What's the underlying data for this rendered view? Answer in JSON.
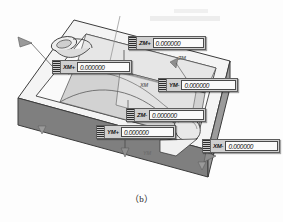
{
  "figure": {
    "caption": "（b）"
  },
  "callouts": [
    {
      "id": "zm-plus",
      "tag": "ZM+",
      "value": "0.000000",
      "grip": "drag-grip"
    },
    {
      "id": "xm-plus",
      "tag": "XM+",
      "value": "0.000000",
      "grip": "drag-grip"
    },
    {
      "id": "ym-minus",
      "tag": "YM-",
      "value": "0.000000",
      "grip": "drag-grip"
    },
    {
      "id": "zm-minus",
      "tag": "ZM-",
      "value": "0.000000",
      "grip": "drag-grip"
    },
    {
      "id": "ym-plus",
      "tag": "YM+",
      "value": "0.000000",
      "grip": "drag-grip"
    },
    {
      "id": "xm-minus",
      "tag": "XM-",
      "value": "0.000000",
      "grip": "drag-grip"
    }
  ],
  "axis_labels": {
    "zm": "ZM",
    "xm": "XM",
    "ym": "YM",
    "extra": "C"
  },
  "colors": {
    "background": "#fdfdfd",
    "block_top": "#f2f2f2",
    "block_front": "#808080",
    "block_side": "#9a9a9a",
    "pocket_floor": "#d9d9d9",
    "pocket_wall": "#bdbdbd",
    "outline": "#3c3c3c",
    "callout_body": "#cfcfcf",
    "callout_field": "#fbfbfb",
    "arrow": "#8e8e8e",
    "leader": "#4a4a4a"
  }
}
